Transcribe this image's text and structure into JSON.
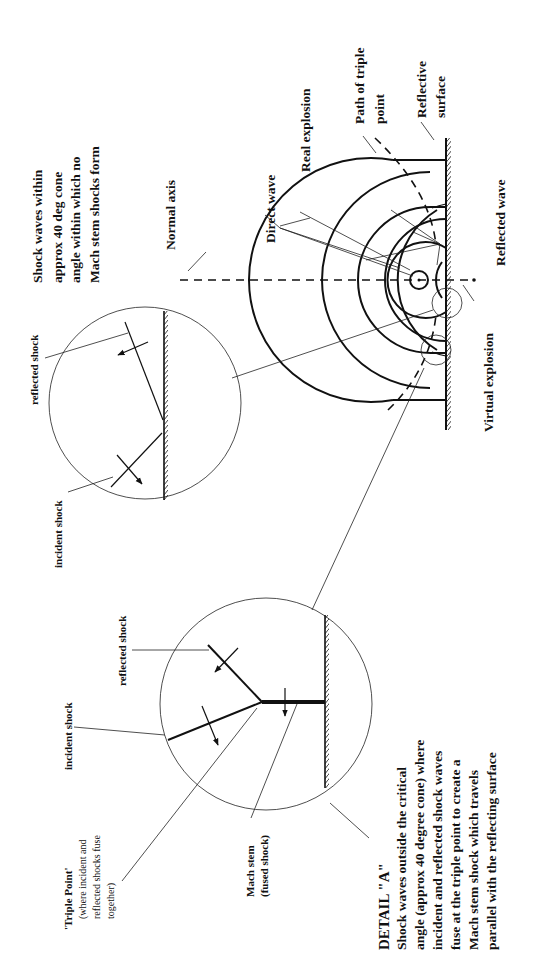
{
  "diagram": {
    "orientation": "rotated 90deg counter-clockwise",
    "main_labels": {
      "cone_note": [
        "Shock waves within",
        "approx 40 deg cone",
        "angle within which no",
        "Mach stem shocks form"
      ],
      "normal_axis": "Normal axis",
      "direct_wave": "Direct wave",
      "real_explosion": "Real explosion",
      "path_of_triple_point": [
        "Path of triple",
        "point"
      ],
      "reflective_surface": [
        "Reflective",
        "surface"
      ],
      "reflected_wave": "Reflected wave",
      "virtual_explosion": "Virtual explosion"
    },
    "detail_upper": {
      "reflected_shock": "reflected shock",
      "incident_shock": "incident shock"
    },
    "detail_lower": {
      "incident_shock": "incident shock",
      "reflected_shock": "reflected shock",
      "triple_point_title": "'Triple Point'",
      "triple_point_desc": [
        "(where incident and",
        "reflected shocks fuse",
        "together)"
      ],
      "mach_stem": [
        "Mach stem",
        "(fused shock)"
      ]
    },
    "detail_a": {
      "heading": "DETAIL \"A\"",
      "text": [
        "Shock waves outside the critical",
        "angle (approx 40 degree cone) where",
        "incident and reflected shock waves",
        "fuse  at the triple point to create a",
        "Mach stem shock which travels",
        "parallel with the reflecting surface"
      ]
    }
  }
}
